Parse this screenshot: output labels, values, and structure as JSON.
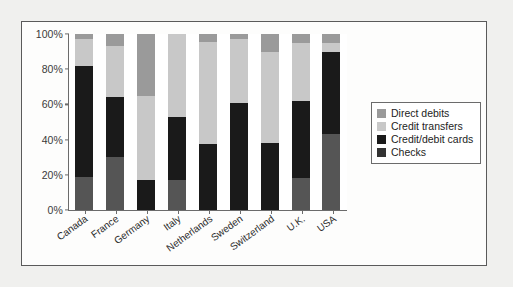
{
  "chart_data": {
    "type": "bar",
    "subtype": "stacked-100-percent",
    "title": "",
    "xlabel": "",
    "ylabel": "",
    "ylim": [
      0,
      100
    ],
    "yticks": [
      "0%",
      "20%",
      "40%",
      "60%",
      "80%",
      "100%"
    ],
    "ytick_values": [
      0,
      20,
      40,
      60,
      80,
      100
    ],
    "grid": false,
    "legend_position": "right",
    "categories": [
      "Canada",
      "France",
      "Germany",
      "Italy",
      "Netherlands",
      "Sweden",
      "Switzerland",
      "U.K.",
      "USA"
    ],
    "series": [
      {
        "name": "Checks",
        "color": "#555555",
        "values": [
          19,
          30,
          0,
          17,
          0,
          0,
          0,
          18,
          43
        ]
      },
      {
        "name": "Credit/debit cards",
        "color": "#1a1a1a",
        "values": [
          63,
          34,
          17,
          36,
          37.5,
          61,
          38,
          44,
          47
        ]
      },
      {
        "name": "Credit transfers",
        "color": "#c8c8c8",
        "values": [
          15,
          29,
          48,
          47,
          58,
          36,
          52,
          33,
          5
        ]
      },
      {
        "name": "Direct debits",
        "color": "#9a9a9a",
        "values": [
          3,
          7,
          35,
          0,
          4.5,
          3,
          10,
          5,
          5
        ]
      }
    ]
  },
  "legend": {
    "items": [
      {
        "label": "Direct debits",
        "color": "#9a9a9a"
      },
      {
        "label": "Credit transfers",
        "color": "#c8c8c8"
      },
      {
        "label": "Credit/debit cards",
        "color": "#1a1a1a"
      },
      {
        "label": "Checks",
        "color": "#333333"
      }
    ]
  },
  "colors": {
    "frame_border": "#5a5a5a",
    "axis": "#6b6b6b",
    "page_background": "#f0f0ee",
    "plot_background": "#ffffff"
  }
}
